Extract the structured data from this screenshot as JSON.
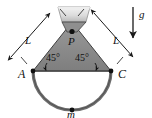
{
  "figure": {
    "type": "physics-free-body-diagram",
    "background_color": "#ffffff",
    "colors": {
      "triangle_fill": "#8a8a8a",
      "triangle_stroke": "#3a3a3a",
      "support_block_fill": "#d8d8d8",
      "support_block_stroke": "#9a9a9a",
      "arc_stroke": "#6e6e6e",
      "chord_stroke": "#555555",
      "dimension_stroke": "#1a1a1a",
      "gravity_arrow": "#1a1a1a",
      "label_color": "#111111"
    },
    "labels": {
      "length_left": "L",
      "length_right": "L",
      "angle_left": "45°",
      "angle_right": "45°",
      "apex_point": "P",
      "left_point": "A",
      "right_point": "C",
      "mass": "m",
      "gravity": "g"
    },
    "points": {
      "apex": {
        "x": 72,
        "y": 33
      },
      "left": {
        "x": 33,
        "y": 71
      },
      "right": {
        "x": 111,
        "y": 71
      },
      "mass": {
        "x": 72,
        "y": 110
      }
    },
    "geometry": {
      "angle_degrees": 45,
      "cord_label": "L",
      "arc_type": "semicircular",
      "gravity_direction": "down"
    }
  }
}
